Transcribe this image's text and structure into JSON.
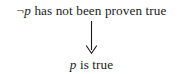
{
  "figure": {
    "type": "logical-inference-diagram",
    "background_color": "#ffffff",
    "text_color": "#1a1a1a",
    "premise": {
      "negation_symbol": "¬",
      "variable": "p",
      "statement": " has not been proven true",
      "full_text": "¬p has not been proven true"
    },
    "arrow": {
      "icon": "arrow-down-icon",
      "direction": "down",
      "head_style": "open-v",
      "color": "#1a1a1a"
    },
    "conclusion": {
      "variable": "p",
      "statement": " is true",
      "full_text": "p is true"
    }
  }
}
